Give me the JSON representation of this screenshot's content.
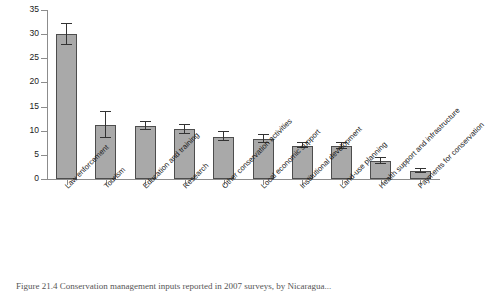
{
  "figure": {
    "caption": "Figure 21.4 Conservation management inputs reported in 2007 surveys, by Nicaragua..."
  },
  "chart_data": {
    "type": "bar",
    "title": "",
    "xlabel": "",
    "ylabel": "Percent of human and financial resources",
    "ylim": [
      0,
      35
    ],
    "yticks": [
      0,
      5,
      10,
      15,
      20,
      25,
      30,
      35
    ],
    "ytick_labels": [
      "0",
      "5",
      "10",
      "15",
      "20",
      "25",
      "30",
      "35"
    ],
    "grid": false,
    "legend": "none",
    "bar_color": "#a9a9a9",
    "bar_edge_color": "#4d4d4d",
    "error_color": "#333333",
    "categories": [
      "Law enforcement",
      "Tourism",
      "Education and training",
      "Research",
      "Other conservation activities",
      "Local economic support",
      "Institutional development",
      "Land-use planning",
      "Health support and infrastructure",
      "Payments for conservation"
    ],
    "values": [
      30.0,
      11.2,
      11.0,
      10.3,
      8.8,
      8.3,
      6.9,
      6.8,
      3.8,
      1.7
    ],
    "errors": [
      2.2,
      2.7,
      0.8,
      0.9,
      0.9,
      0.9,
      0.5,
      0.6,
      0.6,
      0.4
    ]
  }
}
